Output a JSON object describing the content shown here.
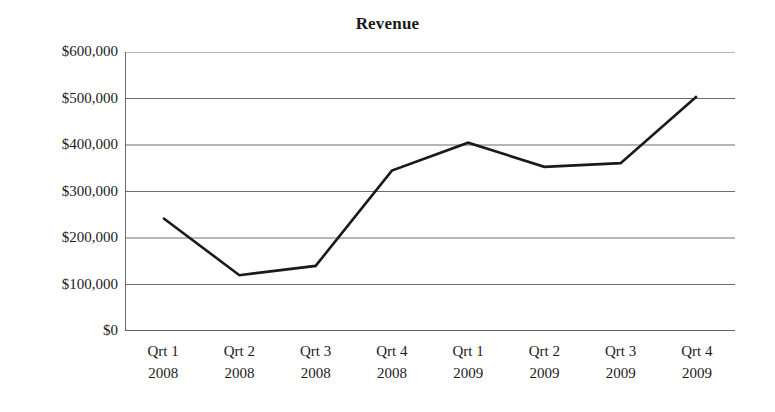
{
  "chart_data": {
    "type": "line",
    "title": "Revenue",
    "xlabel": "",
    "ylabel": "",
    "categories": [
      "Qrt 1\n2008",
      "Qrt 2\n2008",
      "Qrt 3\n2008",
      "Qrt 4\n2008",
      "Qrt 1\n2009",
      "Qrt 2\n2009",
      "Qrt 3\n2009",
      "Qrt 4\n2009"
    ],
    "category_quarters": [
      "Qrt 1",
      "Qrt 2",
      "Qrt 3",
      "Qrt 4",
      "Qrt 1",
      "Qrt 2",
      "Qrt 3",
      "Qrt 4"
    ],
    "category_years": [
      "2008",
      "2008",
      "2008",
      "2008",
      "2009",
      "2009",
      "2009",
      "2009"
    ],
    "values": [
      243000,
      120000,
      140000,
      345000,
      405000,
      353000,
      361000,
      505000
    ],
    "ylim": [
      0,
      600000
    ],
    "ytick_values": [
      600000,
      500000,
      400000,
      300000,
      200000,
      100000,
      0
    ],
    "ytick_labels": [
      "$600,000",
      "$500,000",
      "$400,000",
      "$300,000",
      "$200,000",
      "$100,000",
      "$0"
    ],
    "grid": true,
    "grid_axis": "y",
    "legend": false,
    "legend_position": "none",
    "series": [
      {
        "name": "Revenue",
        "values": [
          243000,
          120000,
          140000,
          345000,
          405000,
          353000,
          361000,
          505000
        ],
        "color": "#1a1a1a",
        "line_width": 2.6,
        "markers": false
      }
    ]
  },
  "style": {
    "background": "#ffffff",
    "line_color": "#1a1a1a",
    "grid_color": "#6e6e6e",
    "axis_color": "#4a4a4a",
    "text_color": "#1b1b1b"
  }
}
